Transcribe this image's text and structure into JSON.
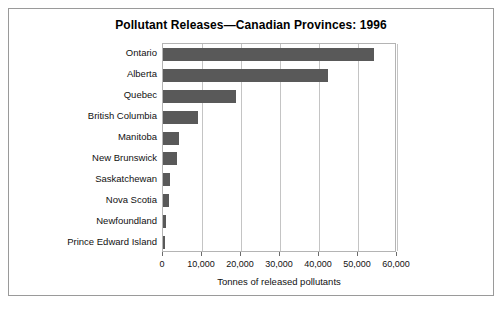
{
  "chart_data": {
    "type": "bar",
    "orientation": "horizontal",
    "title": "Pollutant Releases—Canadian Provinces: 1996",
    "xlabel": "Tonnes of released pollutants",
    "ylabel": "",
    "categories": [
      "Ontario",
      "Alberta",
      "Quebec",
      "British Columbia",
      "Manitoba",
      "New Brunswick",
      "Saskatchewan",
      "Nova Scotia",
      "Newfoundland",
      "Prince Edward Island"
    ],
    "values": [
      54100,
      42300,
      18700,
      9000,
      4200,
      3600,
      1900,
      1600,
      800,
      500
    ],
    "xlim": [
      0,
      60000
    ],
    "xticks": [
      0,
      10000,
      20000,
      30000,
      40000,
      50000,
      60000
    ],
    "xtick_labels": [
      "0",
      "10,000",
      "20,000",
      "30,000",
      "40,000",
      "50,000",
      "60,000"
    ],
    "grid": true,
    "grid_axis": "x",
    "legend": false,
    "bar_color": "#595959",
    "plot_border_color": "#b4b4b4",
    "frame_color": "#9a9a9a",
    "background_color": "#ffffff"
  }
}
